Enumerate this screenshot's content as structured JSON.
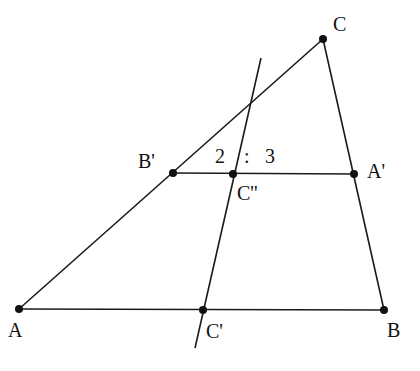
{
  "diagram": {
    "type": "geometry",
    "stroke_color": "#1a1a1a",
    "points": {
      "A": {
        "label": "A",
        "x": 19,
        "y": 309,
        "lx": 8,
        "ly": 337
      },
      "B": {
        "label": "B",
        "x": 384,
        "y": 310,
        "lx": 387,
        "ly": 337
      },
      "C": {
        "label": "C",
        "x": 323,
        "y": 39,
        "lx": 333,
        "ly": 31
      },
      "Cp": {
        "label": "C'",
        "x": 203,
        "y": 310,
        "lx": 206,
        "ly": 338
      },
      "Bp": {
        "label": "B'",
        "x": 173,
        "y": 173,
        "lx": 138,
        "ly": 168
      },
      "Ap": {
        "label": "A'",
        "x": 354,
        "y": 174,
        "lx": 367,
        "ly": 178
      },
      "Cpp": {
        "label": "C''",
        "x": 233,
        "y": 174,
        "lx": 237,
        "ly": 200
      }
    },
    "segments": [
      [
        "A",
        "B"
      ],
      [
        "A",
        "C"
      ],
      [
        "C",
        "B"
      ],
      [
        "Bp",
        "Ap"
      ]
    ],
    "extended_line": {
      "x1": 261,
      "y1": 58,
      "x2": 195,
      "y2": 348
    },
    "ratio_label": {
      "text": "2 : 3",
      "left": "2",
      "colon": ":",
      "right": "3"
    }
  }
}
